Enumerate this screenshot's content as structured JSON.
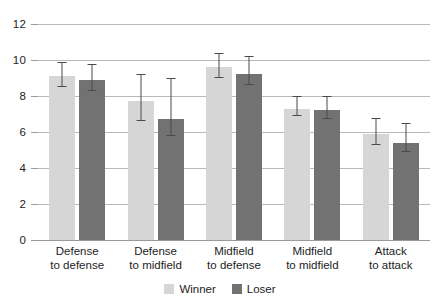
{
  "chart_data": {
    "type": "bar",
    "title": "",
    "xlabel": "",
    "ylabel": "",
    "ylim": [
      0,
      12
    ],
    "yticks": [
      0,
      2,
      4,
      6,
      8,
      10,
      12
    ],
    "grid": true,
    "legend_position": "bottom",
    "categories": [
      "Defense\nto defense",
      "Defense\nto midfield",
      "Midfield\nto defense",
      "Midfield\nto midfield",
      "Attack\nto attack"
    ],
    "category_lines": [
      {
        "line1": "Defense",
        "line2": "to defense"
      },
      {
        "line1": "Defense",
        "line2": "to midfield"
      },
      {
        "line1": "Midfield",
        "line2": "to defense"
      },
      {
        "line1": "Midfield",
        "line2": "to midfield"
      },
      {
        "line1": "Attack",
        "line2": "to attack"
      }
    ],
    "series": [
      {
        "name": "Winner",
        "color": "#d6d6d6",
        "values": [
          9.1,
          7.7,
          9.6,
          7.3,
          5.9
        ],
        "error_low": [
          8.5,
          6.6,
          9.0,
          6.9,
          5.3
        ],
        "error_high": [
          9.9,
          9.2,
          10.4,
          8.0,
          6.8
        ]
      },
      {
        "name": "Loser",
        "color": "#727272",
        "values": [
          8.9,
          6.7,
          9.2,
          7.2,
          5.4
        ],
        "error_low": [
          8.3,
          5.8,
          8.6,
          6.7,
          4.9
        ],
        "error_high": [
          9.8,
          9.0,
          10.2,
          8.0,
          6.5
        ]
      }
    ]
  },
  "legend": {
    "winner_label": "Winner",
    "loser_label": "Loser"
  },
  "axis": {
    "tick_0": "0",
    "tick_2": "2",
    "tick_4": "4",
    "tick_6": "6",
    "tick_8": "8",
    "tick_10": "10",
    "tick_12": "12"
  }
}
